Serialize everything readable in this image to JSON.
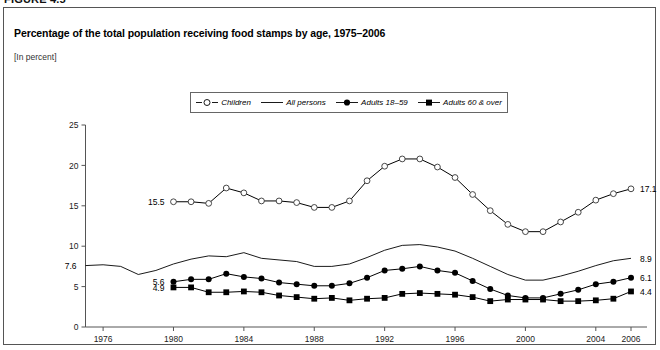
{
  "figure_number": "FIGURE 4.5",
  "chart_title": "Percentage of the total population receiving food stamps by age, 1975–2006",
  "units_label": "[In percent]",
  "legend": [
    {
      "label": "Children",
      "marker": "open-circle",
      "icon": "open-circle-line-icon"
    },
    {
      "label": "All persons",
      "marker": "line",
      "icon": "plain-line-icon"
    },
    {
      "label": "Adults 18–59",
      "marker": "filled-circle",
      "icon": "filled-circle-line-icon"
    },
    {
      "label": "Adults 60 & over",
      "marker": "filled-square",
      "icon": "filled-square-line-icon"
    }
  ],
  "endpoint_labels": {
    "all_persons_start": "7.6",
    "adults_18_59_start": "5.6",
    "adults_60_over_start": "4.9",
    "children_start": "15.5",
    "children_end": "17.1",
    "all_persons_end": "8.9",
    "adults_18_59_end": "6.1",
    "adults_60_over_end": "4.4"
  },
  "chart_data": {
    "type": "line",
    "title": "Percentage of the total population receiving food stamps by age, 1975–2006",
    "subtitle": "[In percent]",
    "xlabel": "",
    "ylabel": "",
    "ylim": [
      0,
      25
    ],
    "xlim": [
      1975,
      2006
    ],
    "yticks": [
      0,
      5,
      10,
      15,
      20,
      25
    ],
    "xticks": [
      1976,
      1980,
      1984,
      1988,
      1992,
      1996,
      2000,
      2004,
      2006
    ],
    "grid": false,
    "legend_position": "top-center",
    "x": [
      1975,
      1976,
      1977,
      1978,
      1979,
      1980,
      1981,
      1982,
      1983,
      1984,
      1985,
      1986,
      1987,
      1988,
      1989,
      1990,
      1991,
      1992,
      1993,
      1994,
      1995,
      1996,
      1997,
      1998,
      1999,
      2000,
      2001,
      2002,
      2003,
      2004,
      2005,
      2006
    ],
    "series": [
      {
        "name": "Children",
        "marker": "open-circle",
        "x": [
          1980,
          1981,
          1982,
          1983,
          1984,
          1985,
          1986,
          1987,
          1988,
          1989,
          1990,
          1991,
          1992,
          1993,
          1994,
          1995,
          1996,
          1997,
          1998,
          1999,
          2000,
          2001,
          2002,
          2003,
          2004,
          2005,
          2006
        ],
        "values": [
          15.5,
          15.5,
          15.3,
          17.2,
          16.6,
          15.6,
          15.6,
          15.4,
          14.8,
          14.8,
          15.6,
          18.1,
          19.9,
          20.8,
          20.8,
          19.8,
          18.5,
          16.4,
          14.4,
          12.7,
          11.8,
          11.8,
          13.0,
          14.2,
          15.7,
          16.5,
          17.1
        ]
      },
      {
        "name": "All persons",
        "marker": "line",
        "x": [
          1975,
          1976,
          1977,
          1978,
          1979,
          1980,
          1981,
          1982,
          1983,
          1984,
          1985,
          1986,
          1987,
          1988,
          1989,
          1990,
          1991,
          1992,
          1993,
          1994,
          1995,
          1996,
          1997,
          1998,
          1999,
          2000,
          2001,
          2002,
          2003,
          2004,
          2005,
          2006
        ],
        "values": [
          7.6,
          7.7,
          7.5,
          6.5,
          7.0,
          7.8,
          8.4,
          8.8,
          8.7,
          9.2,
          8.5,
          8.3,
          8.1,
          7.5,
          7.5,
          7.8,
          8.6,
          9.5,
          10.1,
          10.2,
          9.9,
          9.4,
          8.5,
          7.5,
          6.5,
          5.8,
          5.8,
          6.3,
          6.9,
          7.6,
          8.2,
          8.5
        ]
      },
      {
        "name": "Adults 18–59",
        "marker": "filled-circle",
        "x": [
          1980,
          1981,
          1982,
          1983,
          1984,
          1985,
          1986,
          1987,
          1988,
          1989,
          1990,
          1991,
          1992,
          1993,
          1994,
          1995,
          1996,
          1997,
          1998,
          1999,
          2000,
          2001,
          2002,
          2003,
          2004,
          2005,
          2006
        ],
        "values": [
          5.6,
          5.9,
          5.9,
          6.6,
          6.2,
          6.0,
          5.5,
          5.3,
          5.1,
          5.1,
          5.4,
          6.1,
          7.0,
          7.2,
          7.5,
          7.0,
          6.7,
          5.7,
          4.7,
          3.9,
          3.6,
          3.6,
          4.1,
          4.6,
          5.3,
          5.6,
          6.1
        ]
      },
      {
        "name": "Adults 60 & over",
        "marker": "filled-square",
        "x": [
          1980,
          1981,
          1982,
          1983,
          1984,
          1985,
          1986,
          1987,
          1988,
          1989,
          1990,
          1991,
          1992,
          1993,
          1994,
          1995,
          1996,
          1997,
          1998,
          1999,
          2000,
          2001,
          2002,
          2003,
          2004,
          2005,
          2006
        ],
        "values": [
          4.9,
          4.9,
          4.3,
          4.3,
          4.4,
          4.3,
          3.9,
          3.7,
          3.5,
          3.6,
          3.3,
          3.5,
          3.6,
          4.1,
          4.2,
          4.1,
          4.0,
          3.7,
          3.2,
          3.4,
          3.4,
          3.4,
          3.2,
          3.2,
          3.3,
          3.5,
          4.4
        ]
      }
    ],
    "annotations": [
      {
        "text": "7.6",
        "series": "All persons",
        "x": 1975,
        "y": 7.6,
        "side": "left"
      },
      {
        "text": "5.6",
        "series": "Adults 18–59",
        "x": 1980,
        "y": 5.6,
        "side": "left"
      },
      {
        "text": "4.9",
        "series": "Adults 60 & over",
        "x": 1980,
        "y": 4.9,
        "side": "left"
      },
      {
        "text": "15.5",
        "series": "Children",
        "x": 1980,
        "y": 15.5,
        "side": "left"
      },
      {
        "text": "17.1",
        "series": "Children",
        "x": 2006,
        "y": 17.1,
        "side": "right"
      },
      {
        "text": "8.9",
        "series": "All persons",
        "x": 2006,
        "y": 8.5,
        "side": "right"
      },
      {
        "text": "6.1",
        "series": "Adults 18–59",
        "x": 2006,
        "y": 6.1,
        "side": "right"
      },
      {
        "text": "4.4",
        "series": "Adults 60 & over",
        "x": 2006,
        "y": 4.4,
        "side": "right"
      }
    ]
  }
}
